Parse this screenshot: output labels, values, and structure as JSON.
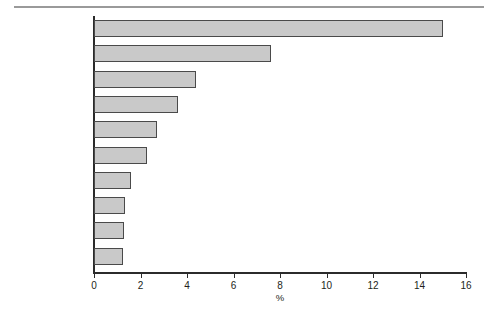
{
  "chart_data": {
    "type": "bar",
    "orientation": "horizontal",
    "title": "",
    "xlabel": "%",
    "ylabel": "",
    "xlim": [
      0,
      16
    ],
    "xticks": [
      0,
      2,
      4,
      6,
      8,
      10,
      12,
      14,
      16
    ],
    "xtick_labels": [
      "0",
      "2",
      "4",
      "6",
      "8",
      "10",
      "12",
      "14",
      "16"
    ],
    "grid": false,
    "legend": null,
    "categories": [
      "Vancouver",
      "Toronto",
      "Calgary",
      "Edmonton",
      "Victoria",
      "Ottawa–Gatineau",
      "Windsor",
      "Saskatoon",
      "Winnipeg",
      "Montréal"
    ],
    "values": [
      15.0,
      7.6,
      4.4,
      3.6,
      2.7,
      2.3,
      1.6,
      1.35,
      1.3,
      1.25
    ],
    "bar_fill_color": "#c9c9c9",
    "bar_edge_color": "#4a4a4a",
    "axis_color": "#2b2b2b",
    "text_color": "#231f20",
    "rule_color": "#9a9a9a"
  }
}
